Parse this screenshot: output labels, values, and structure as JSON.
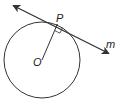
{
  "diagram": {
    "labels": {
      "point_p": "P",
      "center_o": "O",
      "line_m": "m"
    },
    "colors": {
      "stroke": "#333333",
      "background": "#ffffff"
    },
    "elements": [
      {
        "type": "circle",
        "name": "circle-O",
        "center": [
          42,
          59
        ],
        "radius": 38
      },
      {
        "type": "segment",
        "name": "radius-OP",
        "from": [
          42,
          59
        ],
        "to": [
          57,
          25
        ]
      },
      {
        "type": "line",
        "name": "tangent-m",
        "from": [
          12,
          5
        ],
        "to": [
          110,
          54
        ],
        "arrows": "both"
      },
      {
        "type": "right-angle-marker",
        "at": [
          57,
          25
        ]
      }
    ]
  }
}
